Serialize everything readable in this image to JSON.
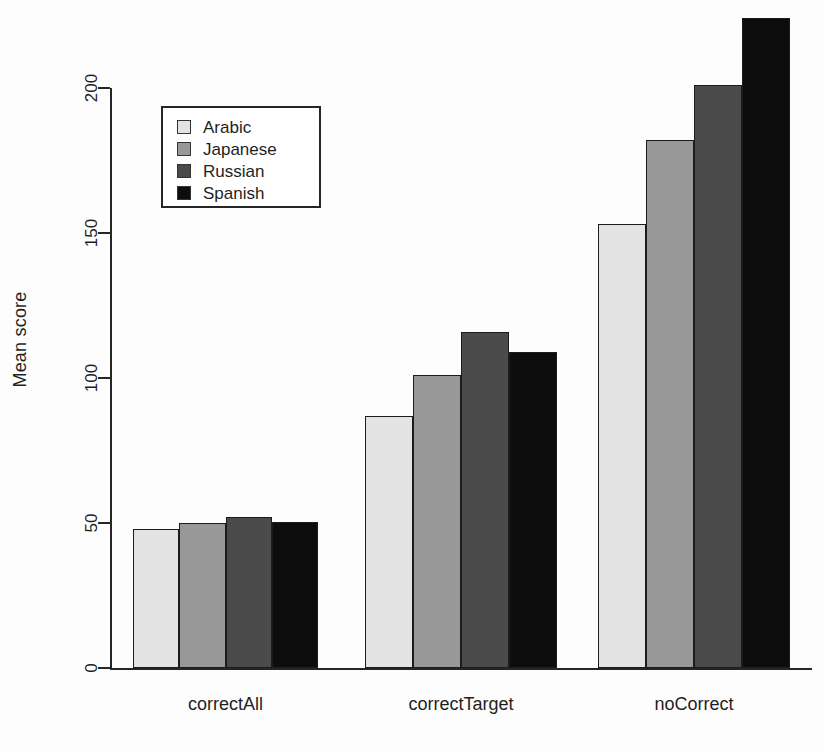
{
  "chart_data": {
    "type": "bar",
    "title": "",
    "xlabel": "",
    "ylabel": "Mean score",
    "categories": [
      "correctAll",
      "correctTarget",
      "noCorrect"
    ],
    "series": [
      {
        "name": "Arabic",
        "color": "#e3e3e3",
        "values": [
          48,
          87,
          153
        ]
      },
      {
        "name": "Japanese",
        "color": "#989898",
        "values": [
          50,
          101,
          182
        ]
      },
      {
        "name": "Russian",
        "color": "#4b4b4b",
        "values": [
          52,
          116,
          201
        ]
      },
      {
        "name": "Spanish",
        "color": "#0d0d0d",
        "values": [
          50.5,
          109,
          224
        ]
      }
    ],
    "ylim": [
      0,
      232
    ],
    "yticks": [
      0,
      50,
      100,
      150,
      200
    ],
    "ytick_labels": [
      "0",
      "50",
      "100",
      "150",
      "200"
    ],
    "grid": false,
    "legend_position": "top-left",
    "axis_color": "#262626"
  },
  "legend": {
    "items": [
      {
        "label": "Arabic"
      },
      {
        "label": "Japanese"
      },
      {
        "label": "Russian"
      },
      {
        "label": "Spanish"
      }
    ]
  }
}
